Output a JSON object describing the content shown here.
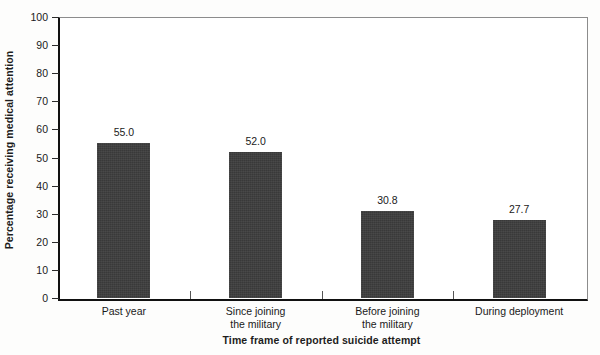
{
  "chart_data": {
    "type": "bar",
    "title": "",
    "subtitle": "",
    "xlabel": "Time frame of reported suicide attempt",
    "ylabel": "Percentage receiving medical attention",
    "categories": [
      "Past year",
      "Since joining the military",
      "Before joining the military",
      "During deployment"
    ],
    "category_lines": [
      [
        "Past year"
      ],
      [
        "Since joining",
        "the military"
      ],
      [
        "Before joining",
        "the military"
      ],
      [
        "During deployment"
      ]
    ],
    "values": [
      55.0,
      52.0,
      30.8,
      27.7
    ],
    "value_labels": [
      "55.0",
      "52.0",
      "30.8",
      "27.7"
    ],
    "ylim": [
      0,
      100
    ],
    "yticks": [
      0,
      10,
      20,
      30,
      40,
      50,
      60,
      70,
      80,
      90,
      100
    ],
    "ytick_labels": [
      "0",
      "10",
      "20",
      "30",
      "40",
      "50",
      "60",
      "70",
      "80",
      "90",
      "100"
    ],
    "grid": false,
    "legend": null,
    "legend_position": "none",
    "bar_color": "#3c3c3c",
    "axis_color": "#111111",
    "frame_color": "#8c8c8c",
    "background": "#ffffff"
  }
}
